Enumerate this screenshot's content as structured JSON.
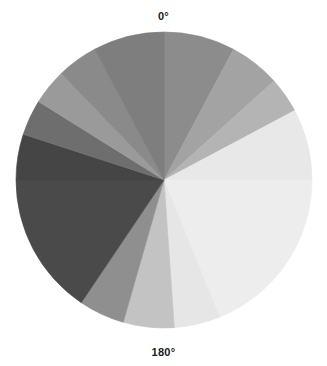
{
  "chart_data": {
    "type": "pie",
    "title": "",
    "subtitle": "",
    "xlabel": "",
    "ylabel": "",
    "legend": "none",
    "grid": false,
    "orientation": "clockwise-from-top",
    "start_angle_deg": 0,
    "axis_labels": [
      {
        "name": "top-angle-label",
        "text": "0°",
        "angle_deg": 0
      },
      {
        "name": "bottom-angle-label",
        "text": "180°",
        "angle_deg": 180
      }
    ],
    "geometry": {
      "center_x": 164,
      "center_y": 180,
      "radius": 148
    },
    "categories": [
      "0°–28°",
      "28°–48°",
      "48°–62°",
      "62°–90°",
      "90°–158°",
      "158°–176°",
      "176°–196°",
      "196°–214°",
      "214°–270°",
      "270°–288°",
      "288°–302°",
      "302°–316°",
      "316°–332°",
      "332°–360°"
    ],
    "values": [
      28,
      20,
      14,
      28,
      68,
      18,
      20,
      18,
      56,
      18,
      14,
      14,
      16,
      28
    ],
    "slices": [
      {
        "name": "slice-01",
        "start_deg": 0,
        "end_deg": 28,
        "sweep_deg": 28,
        "color": "#8c8c8c"
      },
      {
        "name": "slice-02",
        "start_deg": 28,
        "end_deg": 48,
        "sweep_deg": 20,
        "color": "#a3a3a3"
      },
      {
        "name": "slice-03",
        "start_deg": 48,
        "end_deg": 62,
        "sweep_deg": 14,
        "color": "#b4b4b4"
      },
      {
        "name": "slice-04",
        "start_deg": 62,
        "end_deg": 90,
        "sweep_deg": 28,
        "color": "#e8e8e8"
      },
      {
        "name": "slice-05",
        "start_deg": 90,
        "end_deg": 158,
        "sweep_deg": 68,
        "color": "#ededed"
      },
      {
        "name": "slice-06",
        "start_deg": 158,
        "end_deg": 176,
        "sweep_deg": 18,
        "color": "#e6e6e6"
      },
      {
        "name": "slice-07",
        "start_deg": 176,
        "end_deg": 196,
        "sweep_deg": 20,
        "color": "#c3c3c3"
      },
      {
        "name": "slice-08",
        "start_deg": 196,
        "end_deg": 214,
        "sweep_deg": 18,
        "color": "#8f8f8f"
      },
      {
        "name": "slice-09",
        "start_deg": 214,
        "end_deg": 270,
        "sweep_deg": 56,
        "color": "#4a4a4a"
      },
      {
        "name": "slice-10",
        "start_deg": 270,
        "end_deg": 288,
        "sweep_deg": 18,
        "color": "#454545"
      },
      {
        "name": "slice-11",
        "start_deg": 288,
        "end_deg": 302,
        "sweep_deg": 14,
        "color": "#6e6e6e"
      },
      {
        "name": "slice-12",
        "start_deg": 302,
        "end_deg": 316,
        "sweep_deg": 14,
        "color": "#9a9a9a"
      },
      {
        "name": "slice-13",
        "start_deg": 316,
        "end_deg": 332,
        "sweep_deg": 16,
        "color": "#8a8a8a"
      },
      {
        "name": "slice-14",
        "start_deg": 332,
        "end_deg": 360,
        "sweep_deg": 28,
        "color": "#7e7e7e"
      }
    ],
    "background_color": "#ffffff",
    "label_color": "#1a1a1a"
  }
}
